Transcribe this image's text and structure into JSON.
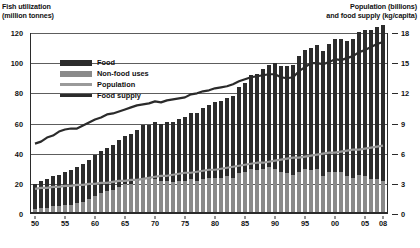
{
  "titles": {
    "left_line1": "Fish utilization",
    "left_line2": "(million tonnes)",
    "right_line1": "Population (billions)",
    "right_line2": "and food supply (kg/capita)"
  },
  "legend": {
    "items": [
      {
        "label": "Food",
        "swatch": "food"
      },
      {
        "label": "Non-food uses",
        "swatch": "nonfood"
      },
      {
        "label": "Population",
        "swatch": "population"
      },
      {
        "label": "Food supply",
        "swatch": "supply"
      }
    ]
  },
  "chart_data": {
    "type": "bar",
    "xlabel": "",
    "ylabel": "Fish utilization (million tonnes)",
    "y2label": "Population (billions) and food supply (kg/capita)",
    "ylim": [
      0,
      120
    ],
    "y2lim": [
      0,
      18
    ],
    "yticks": [
      0,
      20,
      40,
      60,
      80,
      100,
      120
    ],
    "y2ticks": [
      0,
      3,
      6,
      9,
      12,
      15,
      18
    ],
    "grid": true,
    "legend_position": "upper-left-inside",
    "x": [
      1950,
      1951,
      1952,
      1953,
      1954,
      1955,
      1956,
      1957,
      1958,
      1959,
      1960,
      1961,
      1962,
      1963,
      1964,
      1965,
      1966,
      1967,
      1968,
      1969,
      1970,
      1971,
      1972,
      1973,
      1974,
      1975,
      1976,
      1977,
      1978,
      1979,
      1980,
      1981,
      1982,
      1983,
      1984,
      1985,
      1986,
      1987,
      1988,
      1989,
      1990,
      1991,
      1992,
      1993,
      1994,
      1995,
      1996,
      1997,
      1998,
      1999,
      2000,
      2001,
      2002,
      2003,
      2004,
      2005,
      2006,
      2007,
      2008
    ],
    "xtick_labels": [
      "50",
      "55",
      "60",
      "65",
      "70",
      "75",
      "80",
      "85",
      "90",
      "95",
      "00",
      "05",
      "08"
    ],
    "xtick_years": [
      1950,
      1955,
      1960,
      1965,
      1970,
      1975,
      1980,
      1985,
      1990,
      1995,
      2000,
      2005,
      2008
    ],
    "series": [
      {
        "name": "Food",
        "type": "bar-stack-top",
        "unit": "million tonnes",
        "values": [
          17,
          18,
          19,
          20,
          21,
          22,
          23,
          24,
          25,
          26,
          27,
          28,
          29,
          30,
          31,
          32,
          33,
          34,
          35,
          36,
          38,
          38,
          39,
          40,
          41,
          42,
          44,
          45,
          47,
          48,
          50,
          51,
          52,
          54,
          57,
          59,
          62,
          64,
          66,
          68,
          70,
          70,
          71,
          73,
          77,
          79,
          81,
          82,
          83,
          85,
          88,
          88,
          90,
          92,
          95,
          97,
          99,
          101,
          103
        ]
      },
      {
        "name": "Non-food uses",
        "type": "bar-stack-bottom",
        "unit": "million tonnes",
        "values": [
          3,
          4,
          4,
          5,
          5,
          6,
          6,
          7,
          8,
          10,
          12,
          14,
          15,
          16,
          18,
          20,
          20,
          22,
          24,
          23,
          23,
          22,
          22,
          21,
          22,
          22,
          23,
          22,
          23,
          24,
          24,
          24,
          25,
          24,
          27,
          28,
          30,
          29,
          30,
          31,
          30,
          28,
          27,
          26,
          28,
          30,
          29,
          30,
          25,
          28,
          28,
          28,
          25,
          24,
          26,
          25,
          23,
          23,
          22
        ]
      },
      {
        "name": "Population",
        "type": "line",
        "unit": "billions",
        "values": [
          2.5,
          2.6,
          2.6,
          2.7,
          2.7,
          2.8,
          2.8,
          2.9,
          2.9,
          3.0,
          3.0,
          3.1,
          3.1,
          3.2,
          3.3,
          3.3,
          3.4,
          3.4,
          3.5,
          3.6,
          3.7,
          3.8,
          3.8,
          3.9,
          4.0,
          4.1,
          4.1,
          4.2,
          4.3,
          4.4,
          4.4,
          4.5,
          4.6,
          4.7,
          4.8,
          4.9,
          5.0,
          5.1,
          5.1,
          5.2,
          5.3,
          5.4,
          5.5,
          5.6,
          5.6,
          5.7,
          5.8,
          5.9,
          6.0,
          6.1,
          6.1,
          6.2,
          6.3,
          6.4,
          6.4,
          6.5,
          6.6,
          6.7,
          6.8
        ]
      },
      {
        "name": "Food supply",
        "type": "line",
        "unit": "kg/capita",
        "values": [
          7.0,
          7.2,
          7.6,
          7.8,
          8.2,
          8.4,
          8.5,
          8.5,
          8.8,
          9.1,
          9.4,
          9.6,
          9.9,
          10.0,
          10.2,
          10.4,
          10.6,
          10.8,
          10.9,
          11.0,
          11.2,
          11.1,
          11.3,
          11.4,
          11.5,
          11.6,
          11.9,
          12.0,
          12.2,
          12.3,
          12.5,
          12.6,
          12.7,
          12.9,
          13.2,
          13.4,
          13.6,
          13.7,
          13.8,
          13.9,
          13.9,
          13.6,
          13.5,
          13.6,
          14.2,
          14.6,
          15.0,
          15.0,
          14.9,
          15.1,
          15.4,
          15.3,
          15.5,
          15.7,
          16.1,
          16.3,
          16.6,
          16.9,
          17.1
        ]
      }
    ]
  }
}
